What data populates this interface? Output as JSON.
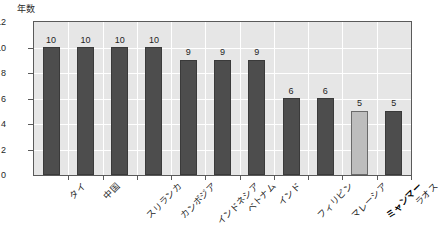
{
  "chart_data": {
    "type": "bar",
    "title": "",
    "xlabel": "",
    "ylabel": "年数",
    "ylim": [
      0,
      12
    ],
    "yticks": [
      0,
      2,
      4,
      6,
      8,
      10,
      12
    ],
    "grid": true,
    "legend": "none",
    "categories": [
      "タイ",
      "中国",
      "スリランカ",
      "カンボジア",
      "インドネシア",
      "ベトナム",
      "インド",
      "フィリピン",
      "マレーシア",
      "ミャンマー",
      "ラオス"
    ],
    "values": [
      10,
      10,
      10,
      10,
      9,
      9,
      9,
      6,
      6,
      5,
      5
    ],
    "data_labels": [
      "10",
      "10",
      "10",
      "10",
      "9",
      "9",
      "9",
      "6",
      "6",
      "5",
      "5"
    ],
    "highlight_index": 9,
    "colors": {
      "bar": "#4d4d4d",
      "bar_border": "#3a3a3a",
      "bar_highlight": "#bdbdbd",
      "bar_highlight_border": "#6a6a6a",
      "plot_background": "#e6e6e6",
      "gridline": "#ffffff",
      "frame": "#5a5a5a",
      "text": "#1f1f1f",
      "page_background": "#ffffff"
    }
  },
  "axis": {
    "y_title": "年数",
    "y_tick_labels": [
      "12",
      "10",
      "8",
      "6",
      "4",
      "2",
      "0"
    ]
  }
}
